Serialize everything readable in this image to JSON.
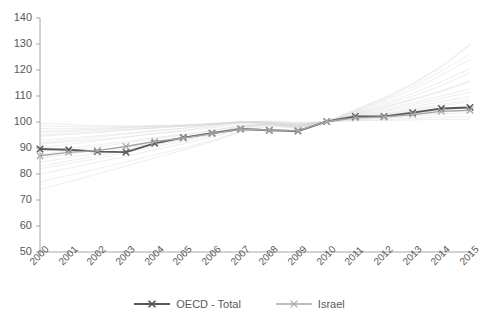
{
  "chart_data": {
    "type": "line",
    "title": "",
    "xlabel": "",
    "ylabel": "",
    "categories": [
      "2000",
      "2001",
      "2002",
      "2003",
      "2004",
      "2005",
      "2006",
      "2007",
      "2008",
      "2009",
      "2010",
      "2011",
      "2012",
      "2013",
      "2014",
      "2015"
    ],
    "x": [
      2000,
      2001,
      2002,
      2003,
      2004,
      2005,
      2006,
      2007,
      2008,
      2009,
      2010,
      2011,
      2012,
      2013,
      2014,
      2015
    ],
    "ylim": [
      50,
      140
    ],
    "yticks": [
      50,
      60,
      70,
      80,
      90,
      100,
      110,
      120,
      130,
      140
    ],
    "ytick_labels": [
      "50",
      "60",
      "70",
      "80",
      "90",
      "100",
      "110",
      "120",
      "130",
      "140"
    ],
    "grid": false,
    "legend_position": "bottom",
    "series": [
      {
        "name": "OECD - Total",
        "color": "#595959",
        "marker": "x",
        "values": [
          89.6,
          89.3,
          88.6,
          88.4,
          91.8,
          94.0,
          95.7,
          97.3,
          96.8,
          96.5,
          100.2,
          102.1,
          102.1,
          103.6,
          105.2,
          105.6
        ]
      },
      {
        "name": "Israel",
        "color": "#a6a6a6",
        "marker": "x",
        "values": [
          87.0,
          88.3,
          89.0,
          90.6,
          92.5,
          93.8,
          95.5,
          97.2,
          96.9,
          96.7,
          100.2,
          101.6,
          101.9,
          102.9,
          104.1,
          104.5
        ]
      }
    ],
    "background_series_note": "faint light-grey lines for other OECD countries",
    "background_series": [
      {
        "values": [
          96.0,
          96.3,
          96.8,
          97.2,
          97.8,
          98.3,
          99.0,
          99.6,
          99.3,
          98.9,
          100.1,
          101.3,
          102.2,
          103.4,
          104.6,
          105.5
        ]
      },
      {
        "values": [
          94.5,
          95.2,
          95.9,
          96.8,
          97.6,
          98.4,
          99.2,
          100.1,
          99.6,
          98.8,
          100.0,
          101.8,
          103.0,
          104.6,
          106.2,
          107.6
        ]
      },
      {
        "values": [
          92.0,
          93.0,
          94.2,
          95.4,
          96.5,
          97.6,
          98.8,
          100.3,
          99.8,
          98.6,
          100.0,
          102.5,
          104.4,
          106.6,
          109.0,
          111.5
        ]
      },
      {
        "values": [
          90.0,
          91.4,
          92.8,
          94.1,
          95.6,
          96.8,
          98.2,
          99.8,
          99.9,
          98.2,
          100.0,
          103.0,
          105.6,
          108.5,
          111.7,
          115.5
        ]
      },
      {
        "values": [
          97.5,
          97.4,
          97.6,
          97.9,
          98.3,
          98.6,
          99.2,
          99.9,
          99.8,
          99.3,
          100.1,
          101.0,
          101.5,
          102.3,
          103.0,
          103.6
        ]
      },
      {
        "values": [
          98.5,
          98.2,
          98.1,
          98.2,
          98.5,
          98.8,
          99.3,
          100.0,
          100.2,
          99.6,
          100.1,
          100.7,
          101.0,
          101.4,
          101.9,
          102.2
        ]
      },
      {
        "values": [
          86.0,
          87.6,
          89.2,
          90.8,
          92.6,
          94.2,
          96.0,
          98.2,
          99.2,
          98.0,
          100.0,
          103.5,
          106.5,
          110.0,
          114.0,
          119.0
        ]
      },
      {
        "values": [
          83.0,
          85.0,
          87.0,
          89.0,
          91.2,
          93.2,
          95.4,
          98.0,
          99.4,
          98.3,
          100.0,
          104.0,
          108.0,
          112.5,
          118.0,
          124.0
        ]
      },
      {
        "values": [
          80.0,
          82.2,
          84.5,
          86.8,
          89.3,
          91.6,
          94.2,
          97.2,
          99.0,
          98.0,
          100.0,
          104.5,
          109.0,
          114.5,
          121.0,
          129.5
        ]
      },
      {
        "values": [
          77.0,
          79.5,
          82.0,
          84.6,
          87.4,
          90.0,
          92.9,
          96.4,
          98.6,
          97.8,
          100.0,
          104.2,
          108.6,
          113.6,
          119.5,
          126.0
        ]
      },
      {
        "values": [
          88.5,
          90.0,
          91.2,
          92.5,
          94.0,
          95.3,
          96.8,
          98.5,
          99.1,
          98.4,
          100.0,
          102.3,
          104.0,
          105.8,
          107.8,
          109.8
        ]
      },
      {
        "values": [
          91.5,
          92.4,
          93.3,
          94.3,
          95.5,
          96.5,
          97.7,
          99.2,
          99.5,
          98.8,
          100.0,
          101.7,
          102.8,
          104.0,
          105.2,
          106.4
        ]
      },
      {
        "values": [
          99.5,
          99.0,
          98.6,
          98.5,
          98.6,
          98.9,
          99.4,
          100.1,
          100.4,
          99.8,
          100.2,
          100.5,
          100.6,
          100.8,
          101.0,
          101.1
        ]
      },
      {
        "values": [
          84.5,
          86.3,
          88.0,
          89.8,
          91.8,
          93.6,
          95.6,
          98.0,
          99.0,
          98.1,
          100.0,
          103.2,
          105.8,
          108.8,
          112.0,
          115.8
        ]
      },
      {
        "values": [
          95.0,
          95.6,
          96.2,
          97.0,
          97.8,
          98.5,
          99.3,
          100.2,
          99.9,
          99.0,
          100.0,
          101.5,
          102.4,
          103.5,
          104.6,
          105.6
        ]
      },
      {
        "values": [
          93.0,
          93.8,
          94.7,
          95.7,
          96.7,
          97.6,
          98.6,
          99.8,
          99.7,
          98.9,
          100.0,
          102.0,
          103.4,
          105.0,
          106.8,
          108.4
        ]
      },
      {
        "values": [
          74.0,
          77.0,
          80.0,
          83.0,
          86.2,
          89.2,
          92.4,
          96.2,
          98.4,
          97.6,
          100.0,
          104.8,
          109.4,
          114.8,
          121.5,
          130.0
        ]
      },
      {
        "values": [
          82.0,
          84.0,
          86.0,
          88.2,
          90.5,
          92.6,
          95.0,
          97.8,
          99.2,
          98.2,
          100.0,
          103.8,
          107.2,
          111.0,
          115.5,
          120.5
        ]
      },
      {
        "values": [
          87.5,
          89.0,
          90.4,
          91.9,
          93.6,
          95.0,
          96.6,
          98.6,
          99.2,
          98.3,
          100.0,
          102.8,
          105.0,
          107.4,
          110.0,
          112.8
        ]
      },
      {
        "values": [
          96.5,
          96.8,
          97.2,
          97.7,
          98.2,
          98.7,
          99.3,
          100.0,
          99.8,
          99.2,
          100.1,
          101.2,
          101.9,
          102.8,
          103.7,
          104.5
        ]
      }
    ]
  },
  "legend": {
    "entries": [
      {
        "label": "OECD - Total",
        "color": "#595959"
      },
      {
        "label": "Israel",
        "color": "#a6a6a6"
      }
    ]
  },
  "axes": {
    "axis_color": "#a6a6a6",
    "tick_color": "#a6a6a6",
    "label_color": "#595959"
  }
}
